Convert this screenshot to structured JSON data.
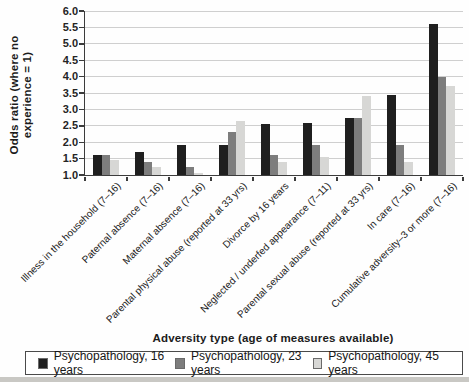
{
  "chart_data": {
    "type": "bar",
    "title": "",
    "xlabel": "Adversity type (age of measures available)",
    "ylabel": "Odds ratio (where no experience = 1)",
    "ylabel_lines": [
      "Odds ratio (where no",
      "experience = 1)"
    ],
    "ylim": [
      1.0,
      6.0
    ],
    "ytick_step": 0.5,
    "grid": true,
    "legend_position": "bottom",
    "categories": [
      "Illness in the household (7–16)",
      "Paternal absence (7–16)",
      "Maternal absence (7–16)",
      "Parental physical abuse (reported at 33 yrs)",
      "Divorce by 16 years",
      "Neglected / underfed appearance (7–11)",
      "Parental sexual abuse (reported at 33 yrs)",
      "In care (7–16)",
      "Cumulative adversity–3 or more (7–16)"
    ],
    "series": [
      {
        "name": "Psychopathology, 16 years",
        "color": "#1f1f1f",
        "values": [
          1.6,
          1.7,
          1.9,
          1.9,
          2.55,
          2.6,
          2.75,
          3.45,
          5.6
        ]
      },
      {
        "name": "Psychopathology, 23 years",
        "color": "#7d7d7d",
        "values": [
          1.6,
          1.4,
          1.25,
          2.3,
          1.6,
          1.9,
          2.75,
          1.9,
          4.0
        ]
      },
      {
        "name": "Psychopathology, 45 years",
        "color": "#d7d7d5",
        "values": [
          1.45,
          1.25,
          1.05,
          2.65,
          1.4,
          1.55,
          3.4,
          1.4,
          3.7
        ]
      }
    ]
  },
  "colors": {
    "gridline": "#cfcfcf",
    "axis": "#3c3c3c",
    "legend_border": "#4a4a4a"
  }
}
